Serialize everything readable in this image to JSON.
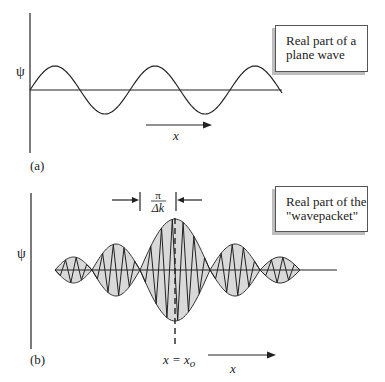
{
  "panels": {
    "a": {
      "label": "(a)",
      "psi_label": "ψ",
      "x_label": "x",
      "caption_line1": "Real part of a",
      "caption_line2": "plane wave"
    },
    "b": {
      "label": "(b)",
      "psi_label": "ψ",
      "x_label": "x",
      "center_label_lhs": "x = x",
      "center_label_sub": "o",
      "width_numerator": "π",
      "width_denominator": "Δk",
      "caption_line1": "Real part of the",
      "caption_line2": "\"wavepacket\""
    }
  },
  "colors": {
    "ink": "#222222",
    "fill": "#d9d9d9",
    "shadow": "#bdbdbd"
  },
  "chart_data": [
    {
      "type": "line",
      "title": "Real part of a plane wave",
      "xlabel": "x",
      "ylabel": "ψ",
      "description": "Sinusoid starting at origin, ~2.3 periods shown",
      "period_px": 100,
      "amplitude_px": 24
    },
    {
      "type": "area",
      "title": "Real part of the \"wavepacket\"",
      "xlabel": "x",
      "ylabel": "ψ",
      "description": "Shaded envelope lobes with fast oscillation inside, centered at x = x_o, central width π/Δk",
      "lobes": [
        {
          "start": 55,
          "end": 92,
          "amplitude": 13
        },
        {
          "start": 92,
          "end": 140,
          "amplitude": 26
        },
        {
          "start": 140,
          "end": 210,
          "amplitude": 51
        },
        {
          "start": 210,
          "end": 260,
          "amplitude": 26
        },
        {
          "start": 260,
          "end": 300,
          "amplitude": 13
        }
      ],
      "center_x": 175,
      "annotations": [
        "π/Δk",
        "x = x_o"
      ]
    }
  ]
}
